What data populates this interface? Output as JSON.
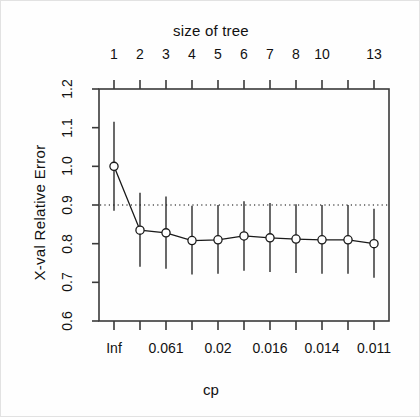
{
  "figure": {
    "top_title": "size of tree",
    "x_axis_label": "cp",
    "y_axis_label": "X-val Relative Error"
  },
  "colors": {
    "line": "#1a1a1a",
    "marker_stroke": "#1a1a1a",
    "marker_fill": "#ffffff",
    "errorbar": "#1a1a1a",
    "refline": "#555555",
    "box": "#3a3a3a",
    "background": "#fefefe"
  },
  "chart_data": {
    "type": "line",
    "title": "size of tree",
    "xlabel": "cp",
    "ylabel": "X-val Relative Error",
    "grid": false,
    "legend": "none",
    "ylim": [
      0.6,
      1.2
    ],
    "y_ticks": [
      "1.2",
      "1.1",
      "1.0",
      "0.9",
      "0.8",
      "0.7",
      "0.6"
    ],
    "y_tick_values": [
      1.2,
      1.1,
      1.0,
      0.9,
      0.8,
      0.7,
      0.6
    ],
    "top_axis_label": "size of tree",
    "top_tick_labels": [
      "1",
      "2",
      "3",
      "4",
      "5",
      "6",
      "7",
      "8",
      "10",
      "13"
    ],
    "top_tick_index": [
      0,
      1,
      2,
      3,
      4,
      5,
      6,
      7,
      8,
      10
    ],
    "bottom_tick_labels": [
      "Inf",
      "0.061",
      "0.02",
      "0.016",
      "0.014",
      "0.011"
    ],
    "bottom_tick_index": [
      0,
      2,
      4,
      6,
      8,
      10
    ],
    "n_points": 11,
    "x": [
      1,
      2,
      3,
      4,
      5,
      6,
      7,
      8,
      9,
      10,
      11
    ],
    "values": [
      1.0,
      0.835,
      0.828,
      0.808,
      0.81,
      0.82,
      0.815,
      0.812,
      0.81,
      0.81,
      0.8
    ],
    "error_lower": [
      0.885,
      0.74,
      0.735,
      0.72,
      0.722,
      0.73,
      0.727,
      0.724,
      0.722,
      0.722,
      0.712
    ],
    "error_upper": [
      1.115,
      0.932,
      0.922,
      0.898,
      0.9,
      0.91,
      0.905,
      0.902,
      0.9,
      0.9,
      0.89
    ],
    "reference_line": {
      "y": 0.9,
      "style": "dotted"
    },
    "marker": "open-circle"
  }
}
